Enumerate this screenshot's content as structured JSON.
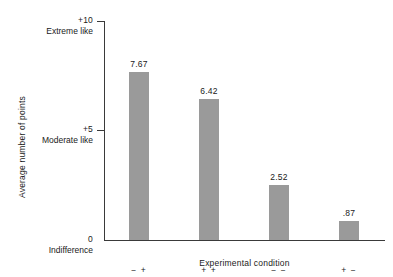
{
  "chart_data": {
    "type": "bar",
    "title": "",
    "xlabel": "Experimental condition",
    "ylabel": "Average number of points",
    "categories": [
      "− +",
      "+ +",
      "− −",
      "+ −"
    ],
    "values": [
      7.67,
      6.42,
      2.52,
      0.87
    ],
    "value_labels": [
      "7.67",
      "6.42",
      "2.52",
      ".87"
    ],
    "ylim": [
      0,
      10
    ],
    "yticks": [
      0,
      5,
      10
    ],
    "ytick_labels": [
      "0",
      "+5",
      "+10"
    ],
    "ytick_captions": [
      "Indifference",
      "Moderate like",
      "Extreme like"
    ],
    "grid": false,
    "legend": "none",
    "bar_color": "#9a9a9a",
    "axis_color": "#3a3a3a",
    "background_color": "#ffffff"
  }
}
